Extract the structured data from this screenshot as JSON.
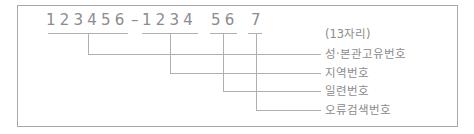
{
  "diagram": {
    "title_note": "(13자리)",
    "groups": [
      {
        "digits": "123456",
        "label": "성·본관고유번호"
      },
      {
        "digits": "1234",
        "label": "지역번호"
      },
      {
        "digits": "56",
        "label": "일련번호"
      },
      {
        "digits": "7",
        "label": "오류검색번호"
      }
    ],
    "separator": "–",
    "colors": {
      "line": "#b0b0b0",
      "text": "#8c8c8c",
      "frame": "#a8a8a8"
    }
  }
}
